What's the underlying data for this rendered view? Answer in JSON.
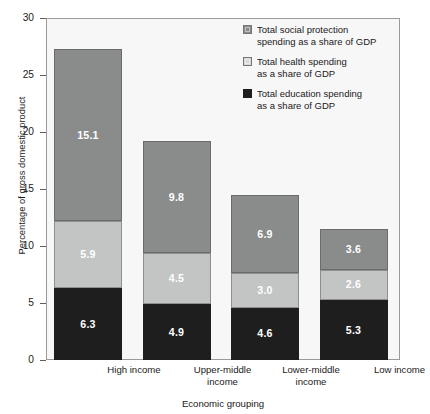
{
  "figure": {
    "supertitle_partial": "",
    "y_axis_title": "Percentage of gross domestic product",
    "x_axis_title": "Economic grouping"
  },
  "legend": {
    "items": [
      {
        "key": "social",
        "line1": "Total social protection",
        "line2": "spending as a share of GDP"
      },
      {
        "key": "health",
        "line1": "Total health spending",
        "line2": "as a share of GDP"
      },
      {
        "key": "educ",
        "line1": "Total education spending",
        "line2": "as a share of GDP"
      }
    ]
  },
  "chart_data": {
    "type": "bar",
    "stacked": true,
    "title": "",
    "xlabel": "Economic grouping",
    "ylabel": "Percentage of gross domestic product",
    "ylim": [
      0,
      30
    ],
    "yticks": [
      0,
      5,
      10,
      15,
      20,
      25,
      30
    ],
    "ytick_labels": [
      "0",
      "5",
      "10",
      "15",
      "20",
      "25",
      "30"
    ],
    "grid": false,
    "legend_position": "upper right (inside plot)",
    "categories": [
      "High income",
      "Upper-middle income",
      "Lower-middle income",
      "Low income"
    ],
    "series": [
      {
        "name": "Total education spending as a share of GDP",
        "color": "#1e1e1e",
        "values": [
          6.3,
          4.9,
          4.6,
          5.3
        ]
      },
      {
        "name": "Total health spending as a share of GDP",
        "color": "#c3c4c4",
        "values": [
          5.9,
          4.5,
          3.0,
          2.6
        ]
      },
      {
        "name": "Total social protection spending as a share of GDP",
        "color": "#8a8c8c",
        "values": [
          15.1,
          9.8,
          6.9,
          3.6
        ]
      }
    ],
    "totals": [
      27.3,
      19.2,
      14.5,
      11.5
    ]
  },
  "x_category_lines": [
    [
      "High income",
      ""
    ],
    [
      "Upper-middle",
      "income"
    ],
    [
      "Lower-middle",
      "income"
    ],
    [
      "Low income",
      ""
    ]
  ],
  "bar_labels": {
    "high_income": {
      "social": "15.1",
      "health": "5.9",
      "educ": "6.3"
    },
    "upper_middle_income": {
      "social": "9.8",
      "health": "4.5",
      "educ": "4.9"
    },
    "lower_middle_income": {
      "social": "6.9",
      "health": "3.0",
      "educ": "4.6"
    },
    "low_income": {
      "social": "3.6",
      "health": "2.6",
      "educ": "5.3"
    }
  }
}
